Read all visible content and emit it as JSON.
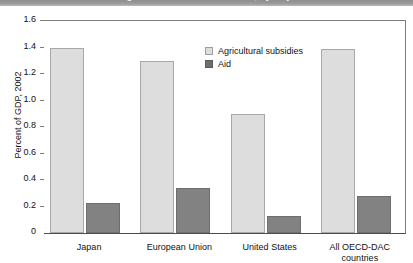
{
  "title_band": {
    "text": "Agricultural subsidies and aid, by major donors",
    "background_color": "#9a9a9a",
    "cropped": "true"
  },
  "chart_data": {
    "type": "bar",
    "title": "Agricultural subsidies and aid, by major donors",
    "xlabel": "",
    "ylabel": "Percent of GDP, 2002",
    "ylim": [
      0,
      1.6
    ],
    "ytick_labels": [
      "0",
      "0.2",
      "0.4",
      "0.6",
      "0.8",
      "1.0",
      "1.2",
      "1.4",
      "1.6"
    ],
    "ytick_values": [
      0,
      0.2,
      0.4,
      0.6,
      0.8,
      1.0,
      1.2,
      1.4,
      1.6
    ],
    "grid": false,
    "legend_position": "upper center",
    "categories": [
      "Japan",
      "European Union",
      "United States",
      "All OECD-DAC countries"
    ],
    "category_lines": [
      [
        "Japan"
      ],
      [
        "European Union"
      ],
      [
        "United States"
      ],
      [
        "All OECD-DAC",
        "countries"
      ]
    ],
    "series": [
      {
        "name": "Agricultural subsidies",
        "color": "#dddddd",
        "values": [
          1.4,
          1.3,
          0.9,
          1.39
        ]
      },
      {
        "name": "Aid",
        "color": "#828282",
        "values": [
          0.23,
          0.34,
          0.13,
          0.28
        ]
      }
    ]
  },
  "axis": {
    "y_title": "Percent of GDP, 2002"
  },
  "legend": {
    "items": [
      {
        "label": "Agricultural subsidies",
        "key": "subsidies"
      },
      {
        "label": "Aid",
        "key": "aid"
      }
    ]
  }
}
